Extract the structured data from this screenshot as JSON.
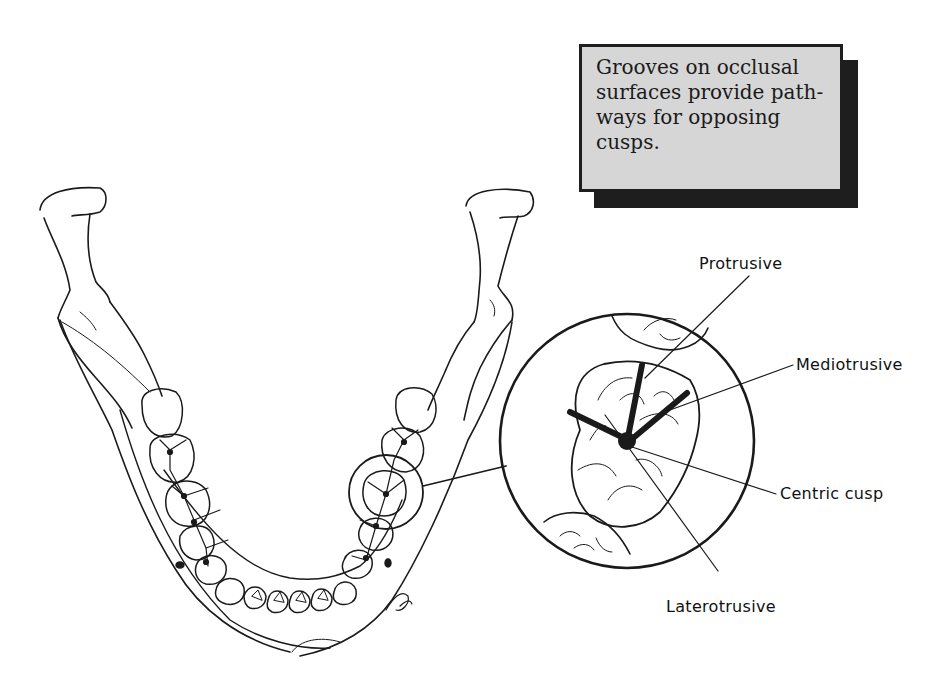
{
  "figure": {
    "callout": {
      "text": "Grooves on occlusal surfaces provide path-ways for opposing cusps.",
      "lines": [
        "Grooves on occlusal",
        "surfaces provide path-",
        "ways for opposing",
        "cusps."
      ],
      "fill_color": "#d6d6d6",
      "shadow_color": "#1e1e1e"
    },
    "labels": {
      "protrusive": "Protrusive",
      "mediotrusive": "Mediotrusive",
      "centric_cusp": "Centric cusp",
      "laterotrusive": "Laterotrusive"
    },
    "signature": "AO"
  }
}
